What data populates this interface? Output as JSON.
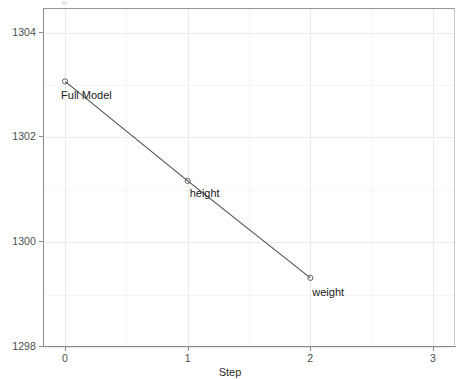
{
  "chart_data": {
    "type": "line",
    "title": "",
    "xlabel": "Step",
    "ylabel": "AIC",
    "x": [
      0,
      1,
      2
    ],
    "values": [
      1303.05,
      1301.15,
      1299.3
    ],
    "point_labels": [
      "Full Model",
      "height",
      "weight"
    ],
    "series": [
      {
        "name": "AIC",
        "values": [
          1303.05,
          1301.15,
          1299.3
        ]
      }
    ],
    "xlim": [
      -0.18,
      3.18
    ],
    "ylim": [
      1298.0,
      1304.45
    ],
    "x_ticks": [
      0,
      1,
      2,
      3
    ],
    "x_tick_labels": [
      "0",
      "1",
      "2",
      "3"
    ],
    "y_ticks": [
      1298,
      1300,
      1302,
      1304
    ],
    "y_tick_labels": [
      "1298",
      "1300",
      "1302",
      "1304"
    ],
    "y_minor_ticks": [
      1299,
      1301,
      1303,
      1304.45
    ],
    "x_minor_ticks": [
      0.5,
      1.5,
      2.5
    ],
    "grid": true,
    "legend": null,
    "marker": "open-circle",
    "line_color": "#4d4d4d",
    "point_color": "#4d4d4d",
    "grid_major_color": "#ebebeb",
    "grid_minor_color": "#f5f5f5",
    "panel_background": "#ffffff"
  },
  "axis": {
    "y_title": "AIC",
    "x_title": "Step"
  }
}
